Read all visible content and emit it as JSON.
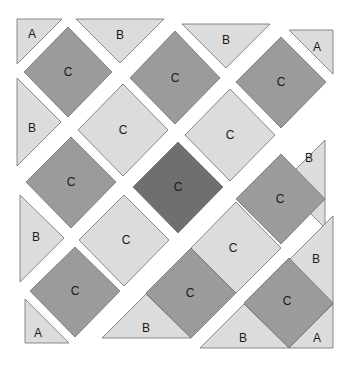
{
  "diagram": {
    "colors": {
      "background": "#ffffff",
      "light": "#dcdcdc",
      "medium": "#9b9b9b",
      "dark": "#6f6f6f",
      "stroke": "#6e6e6e"
    },
    "pieces": [
      {
        "id": "p1",
        "label": "A",
        "shade": "light",
        "points": "17,19 62,19 17,64",
        "lx": 32,
        "ly": 34
      },
      {
        "id": "p2",
        "label": "B",
        "shade": "light",
        "points": "76,19 164,19 120,63",
        "lx": 120,
        "ly": 35
      },
      {
        "id": "p3",
        "label": "B",
        "shade": "light",
        "points": "182,24 270,24 226,68",
        "lx": 226,
        "ly": 40
      },
      {
        "id": "p4",
        "label": "A",
        "shade": "light",
        "points": "289,30 333,30 333,74",
        "lx": 317,
        "ly": 47
      },
      {
        "id": "p5",
        "label": "C",
        "shade": "medium",
        "points": "68,27 112,72 68,117 24,72",
        "lx": 68,
        "ly": 72
      },
      {
        "id": "p6",
        "label": "C",
        "shade": "medium",
        "points": "175,31 220,78 175,124 130,78",
        "lx": 175,
        "ly": 78
      },
      {
        "id": "p7",
        "label": "C",
        "shade": "medium",
        "points": "281,37 326,82 281,128 236,82",
        "lx": 281,
        "ly": 82
      },
      {
        "id": "p8",
        "label": "B",
        "shade": "light",
        "points": "17,78 17,166 61,122",
        "lx": 32,
        "ly": 128
      },
      {
        "id": "p9",
        "label": "C",
        "shade": "light",
        "points": "123,84 168,130 123,176 78,130",
        "lx": 123,
        "ly": 130
      },
      {
        "id": "p10",
        "label": "C",
        "shade": "light",
        "points": "230,89 275,135 230,181 185,135",
        "lx": 230,
        "ly": 135
      },
      {
        "id": "p11",
        "label": "B",
        "shade": "light",
        "points": "325,140 325,228 281,184",
        "lx": 309,
        "ly": 158
      },
      {
        "id": "p12",
        "label": "C",
        "shade": "medium",
        "points": "71,137 116,182 71,228 26,182",
        "lx": 71,
        "ly": 182
      },
      {
        "id": "p13",
        "label": "C",
        "shade": "dark",
        "points": "178,142 223,187 178,233 133,187",
        "lx": 178,
        "ly": 187
      },
      {
        "id": "p14",
        "label": "C",
        "shade": "medium",
        "points": "281,154 325,199 281,244 236,199",
        "lx": 280,
        "ly": 199
      },
      {
        "id": "p15",
        "label": "B",
        "shade": "light",
        "points": "20,195 20,282 64,238",
        "lx": 36,
        "ly": 237
      },
      {
        "id": "p16",
        "label": "C",
        "shade": "light",
        "points": "124,195 169,240 124,286 79,240",
        "lx": 126,
        "ly": 240
      },
      {
        "id": "p17",
        "label": "C",
        "shade": "light",
        "points": "236,202 281,248 236,293 191,248",
        "lx": 233,
        "ly": 248
      },
      {
        "id": "p18",
        "label": "C",
        "shade": "medium",
        "points": "75,247 120,291 75,337 30,291",
        "lx": 75,
        "ly": 291
      },
      {
        "id": "p19",
        "label": "A",
        "shade": "light",
        "points": "25,299 25,343 69,343",
        "lx": 38,
        "ly": 333
      },
      {
        "id": "p20",
        "label": "C",
        "shade": "medium",
        "points": "191,248 236,293 191,338 146,293",
        "lx": 190,
        "ly": 293
      },
      {
        "id": "p21",
        "label": "B",
        "shade": "light",
        "points": "102,338 191,338 146,294",
        "lx": 146,
        "ly": 328
      },
      {
        "id": "p22",
        "label": "B",
        "shade": "light",
        "points": "333,216 333,304 289,260",
        "lx": 316,
        "ly": 259
      },
      {
        "id": "p23",
        "label": "C",
        "shade": "medium",
        "points": "289,258 333,303 289,348 244,303",
        "lx": 287,
        "ly": 301
      },
      {
        "id": "p24",
        "label": "B",
        "shade": "light",
        "points": "200,348 289,348 244,304",
        "lx": 243,
        "ly": 338
      },
      {
        "id": "p25",
        "label": "A",
        "shade": "light",
        "points": "289,348 333,348 333,304",
        "lx": 317,
        "ly": 338
      }
    ]
  }
}
